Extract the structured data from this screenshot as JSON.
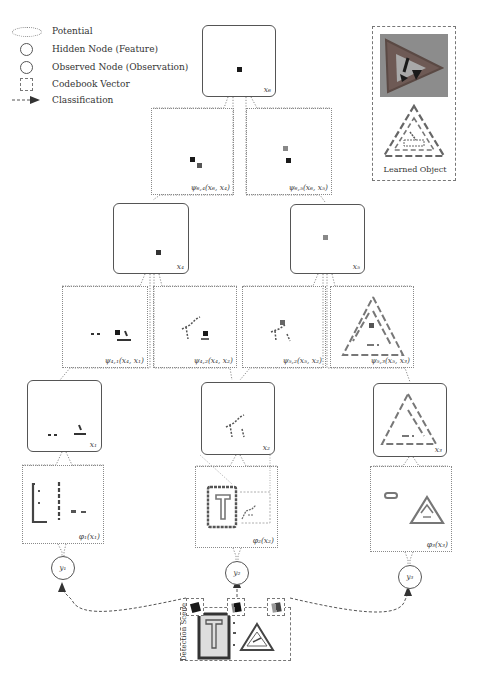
{
  "legend": {
    "items": [
      {
        "symbol": "dotted-ellipse",
        "label": "Potential"
      },
      {
        "symbol": "circle",
        "label": "Hidden Node (Feature)"
      },
      {
        "symbol": "circle",
        "label": "Observed Node (Observation)"
      },
      {
        "symbol": "dashed-square",
        "label": "Codebook Vector"
      },
      {
        "symbol": "dashed-arrow",
        "label": "Classification"
      }
    ]
  },
  "learned_object": {
    "label": "Learned Object"
  },
  "hidden_nodes": {
    "x6": {
      "label": "x₆"
    },
    "x4": {
      "label": "x₄"
    },
    "x5": {
      "label": "x₅"
    },
    "x1": {
      "label": "x₁"
    },
    "x2": {
      "label": "x₂"
    },
    "x3": {
      "label": "x₃"
    }
  },
  "pairwise_potentials": {
    "psi64": {
      "label": "ψ₆,₄(x₆, x₄)"
    },
    "psi65": {
      "label": "ψ₆,₅(x₆, x₅)"
    },
    "psi41": {
      "label": "ψ₄,₁(x₄, x₁)"
    },
    "psi42": {
      "label": "ψ₄,₂(x₄, x₂)"
    },
    "psi52": {
      "label": "ψ₅,₂(x₅, x₂)"
    },
    "psi53": {
      "label": "ψ₅,₃(x₅, x₃)"
    }
  },
  "unary_potentials": {
    "phi1": {
      "label": "φ₁(x₁)"
    },
    "phi2": {
      "label": "φ₂(x₂)"
    },
    "phi3": {
      "label": "φ₃(x₃)"
    }
  },
  "observed_nodes": {
    "y1": {
      "label": "y₁"
    },
    "y2": {
      "label": "y₂"
    },
    "y3": {
      "label": "y₃"
    }
  },
  "detection_scene": {
    "label": "Detection Scene"
  },
  "colors": {
    "node_border": "#555555",
    "potential_border": "#8a8a8a",
    "feature_dark": "#1a1a1a",
    "feature_gray": "#7a7a7a",
    "codebook_border": "#777777"
  }
}
